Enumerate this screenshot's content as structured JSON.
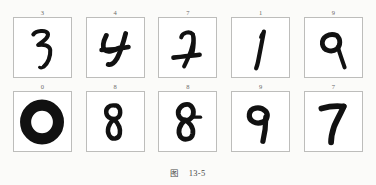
{
  "figure": {
    "caption_prefix": "图",
    "caption_number": "13-5",
    "caption_full": "图 13-5"
  },
  "grid": {
    "rows": 2,
    "cols": 5,
    "cells": [
      {
        "label": "3",
        "digit": "3",
        "name": "digit-panel-r1c1"
      },
      {
        "label": "4",
        "digit": "4",
        "name": "digit-panel-r1c2"
      },
      {
        "label": "7",
        "digit": "7",
        "name": "digit-panel-r1c3"
      },
      {
        "label": "1",
        "digit": "1",
        "name": "digit-panel-r1c4"
      },
      {
        "label": "9",
        "digit": "9",
        "name": "digit-panel-r1c5"
      },
      {
        "label": "0",
        "digit": "0",
        "name": "digit-panel-r2c1"
      },
      {
        "label": "8",
        "digit": "8",
        "name": "digit-panel-r2c2"
      },
      {
        "label": "8",
        "digit": "8",
        "name": "digit-panel-r2c3"
      },
      {
        "label": "9",
        "digit": "9",
        "name": "digit-panel-r2c4"
      },
      {
        "label": "7",
        "digit": "7",
        "name": "digit-panel-r2c5"
      }
    ],
    "row1_labels": [
      "3",
      "4",
      "7",
      "1",
      "9"
    ],
    "row2_labels": [
      "0",
      "8",
      "8",
      "9",
      "7"
    ]
  },
  "colors": {
    "page_background": "#fbfbf9",
    "panel_background": "#ffffff",
    "panel_border": "#bdbdbb",
    "digit_ink": "#111111",
    "label_text": "#6a6a68",
    "caption_text": "#4a4a48"
  }
}
